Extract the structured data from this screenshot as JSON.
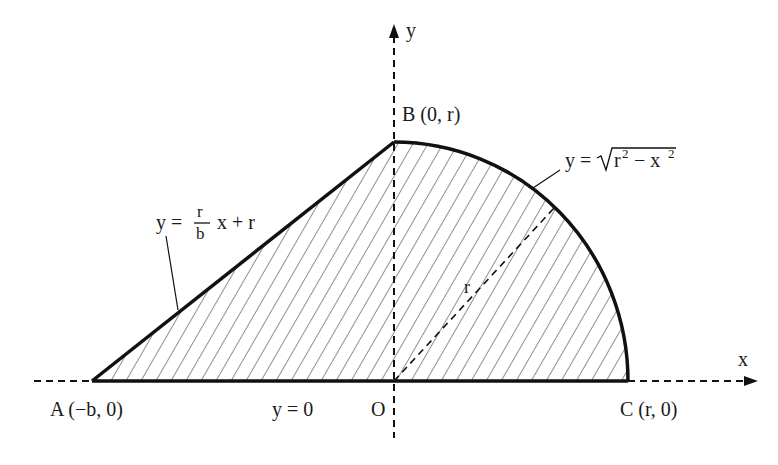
{
  "diagram": {
    "type": "region-geometry",
    "colors": {
      "stroke": "#111111",
      "background": "#ffffff",
      "hatch": "#222222"
    },
    "axes": {
      "x_label": "x",
      "y_label": "y",
      "origin_label": "O"
    },
    "points": {
      "A": "A (−b, 0)",
      "B": "B (0, r)",
      "C": "C (r, 0)"
    },
    "equations": {
      "line": {
        "lhs": "y =",
        "num": "r",
        "den": "b",
        "rhs": "x + r"
      },
      "arc": {
        "lhs": "y =",
        "radicand_r": "r",
        "sup1": "2",
        "minus": "− x",
        "sup2": "2"
      },
      "base": "y = 0"
    },
    "radius_label": "r"
  }
}
